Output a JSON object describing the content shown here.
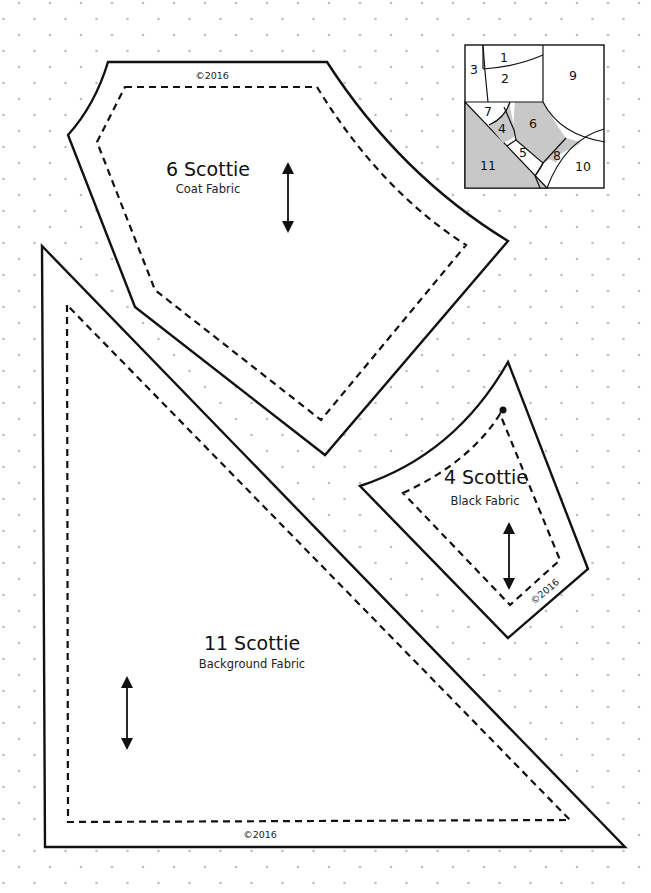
{
  "page": {
    "background": "#ffffff",
    "dot_color": "#bdbdbd",
    "line_color": "#111111",
    "shade_color": "#c8c8c8"
  },
  "pieces": [
    {
      "id": "6",
      "title": "6 Scottie",
      "subtitle": "Coat Fabric",
      "copyright": "©2016"
    },
    {
      "id": "4",
      "title": "4 Scottie",
      "subtitle": "Black Fabric",
      "copyright": "©2016"
    },
    {
      "id": "11",
      "title": "11 Scottie",
      "subtitle": "Background Fabric",
      "copyright": "©2016"
    }
  ],
  "block_diagram": {
    "labels": [
      "1",
      "2",
      "3",
      "4",
      "5",
      "6",
      "7",
      "8",
      "9",
      "10",
      "11"
    ],
    "shaded": [
      "4",
      "6",
      "11"
    ]
  }
}
